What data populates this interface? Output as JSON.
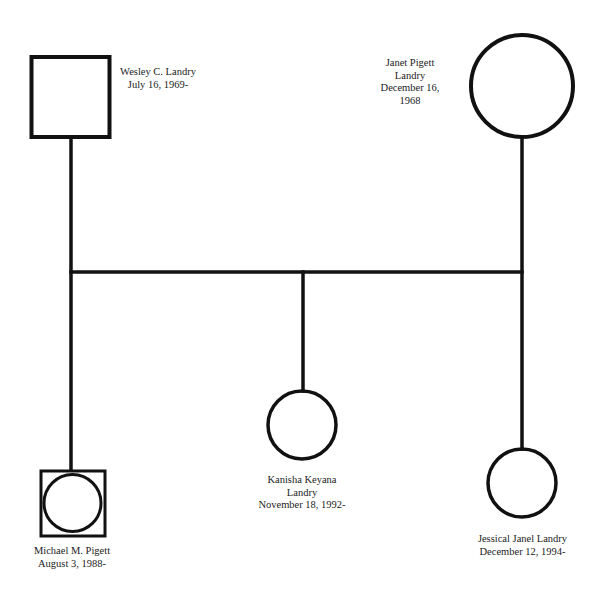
{
  "diagram": {
    "type": "genogram",
    "colors": {
      "line": "#111111",
      "text": "#222222",
      "background": "#ffffff"
    },
    "people": [
      {
        "id": "wesley",
        "shape": "square",
        "gender": "male",
        "lines": [
          "Wesley C. Landry",
          "July 16, 1969-"
        ]
      },
      {
        "id": "janet",
        "shape": "circle",
        "gender": "female",
        "lines": [
          "Janet Pigett",
          "Landry",
          "December 16,",
          "1968"
        ]
      },
      {
        "id": "michael",
        "shape": "square-with-circle",
        "lines": [
          "Michael M. Pigett",
          "August 3, 1988-"
        ]
      },
      {
        "id": "kanisha",
        "shape": "circle",
        "gender": "female",
        "lines": [
          "Kanisha Keyana",
          "Landry",
          "November 18, 1992-"
        ]
      },
      {
        "id": "jessical",
        "shape": "circle",
        "gender": "female",
        "lines": [
          "Jessical Janel Landry",
          "December 12, 1994-"
        ]
      }
    ],
    "relationships": [
      {
        "type": "marriage",
        "between": [
          "wesley",
          "janet"
        ]
      },
      {
        "type": "child",
        "parents": [
          "wesley",
          "janet"
        ],
        "child": "michael"
      },
      {
        "type": "child",
        "parents": [
          "wesley",
          "janet"
        ],
        "child": "kanisha"
      },
      {
        "type": "child",
        "parents": [
          "wesley",
          "janet"
        ],
        "child": "jessical"
      }
    ]
  }
}
